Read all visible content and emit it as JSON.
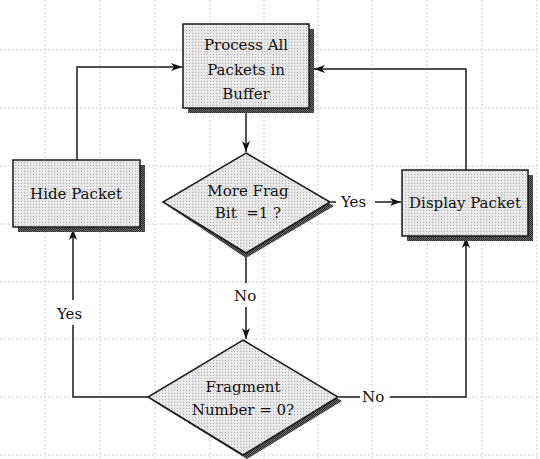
{
  "diagram": {
    "type": "flowchart",
    "colors": {
      "background": "#ffffff",
      "grid": "#c8c8c8",
      "shape_fill": "#e4e4e4",
      "shape_stroke": "#1a1a1a",
      "shadow": "#555555",
      "line": "#1a1a1a"
    },
    "nodes": {
      "process": {
        "shape": "rectangle",
        "lines": [
          "Process All",
          "Packets in",
          "Buffer"
        ]
      },
      "hide": {
        "shape": "rectangle",
        "lines": [
          "Hide Packet"
        ]
      },
      "display": {
        "shape": "rectangle",
        "lines": [
          "Display Packet"
        ]
      },
      "more_frag": {
        "shape": "diamond",
        "lines": [
          "More Frag",
          "Bit  =1 ?"
        ]
      },
      "frag_num": {
        "shape": "diamond",
        "lines": [
          "Fragment",
          "Number = 0?"
        ]
      }
    },
    "edges": [
      {
        "from": "process",
        "to": "more_frag",
        "label": ""
      },
      {
        "from": "more_frag",
        "to": "display",
        "label": "Yes"
      },
      {
        "from": "more_frag",
        "to": "frag_num",
        "label": "No"
      },
      {
        "from": "frag_num",
        "to": "hide",
        "label": "Yes"
      },
      {
        "from": "frag_num",
        "to": "display",
        "label": "No"
      },
      {
        "from": "hide",
        "to": "process",
        "label": ""
      },
      {
        "from": "display",
        "to": "process",
        "label": ""
      }
    ],
    "edge_labels": {
      "more_frag_yes": "Yes",
      "more_frag_no": "No",
      "frag_num_yes": "Yes",
      "frag_num_no": "No"
    }
  }
}
